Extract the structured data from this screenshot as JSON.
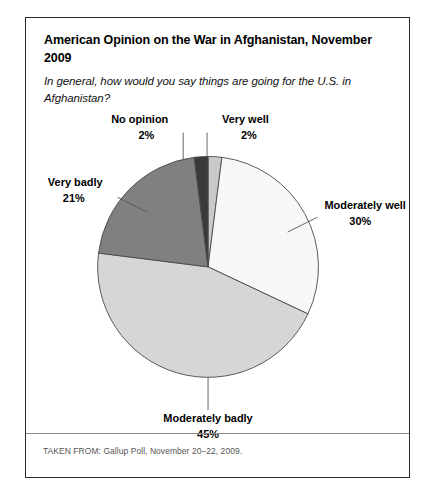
{
  "figure": {
    "title": "American Opinion on the War in Afghanistan, November 2009",
    "subtitle": "In general, how would you say things are going for the U.S. in Afghanistan?",
    "source": "TAKEN FROM: Gallup Poll, November 20–22, 2009."
  },
  "chart_data": {
    "type": "pie",
    "title": "American Opinion on the War in Afghanistan, November 2009",
    "subtitle": "In general, how would you say things are going for the U.S. in Afghanistan?",
    "xlabel": "",
    "ylabel": "",
    "legend": "none",
    "grid": false,
    "start_angle_deg": 0,
    "direction": "clockwise",
    "categories": [
      "Very well",
      "Moderately well",
      "Moderately badly",
      "Very badly",
      "No opinion"
    ],
    "values": [
      2,
      30,
      45,
      21,
      2
    ],
    "unit": "%",
    "colors": [
      "#c9c9c9",
      "#f7f7f7",
      "#d6d6d6",
      "#808080",
      "#3a3a3a"
    ],
    "slices": [
      {
        "label": "Very well",
        "value": 2,
        "value_text": "2%",
        "color": "#c9c9c9"
      },
      {
        "label": "Moderately well",
        "value": 30,
        "value_text": "30%",
        "color": "#f7f7f7"
      },
      {
        "label": "Moderately badly",
        "value": 45,
        "value_text": "45%",
        "color": "#d6d6d6"
      },
      {
        "label": "Very badly",
        "value": 21,
        "value_text": "21%",
        "color": "#808080"
      },
      {
        "label": "No opinion",
        "value": 2,
        "value_text": "2%",
        "color": "#3a3a3a"
      }
    ],
    "annotations": [
      {
        "text": "No opinion",
        "value_text": "2%"
      },
      {
        "text": "Very well",
        "value_text": "2%"
      },
      {
        "text": "Very badly",
        "value_text": "21%"
      },
      {
        "text": "Moderately well",
        "value_text": "30%"
      },
      {
        "text": "Moderately badly",
        "value_text": "45%"
      }
    ]
  }
}
